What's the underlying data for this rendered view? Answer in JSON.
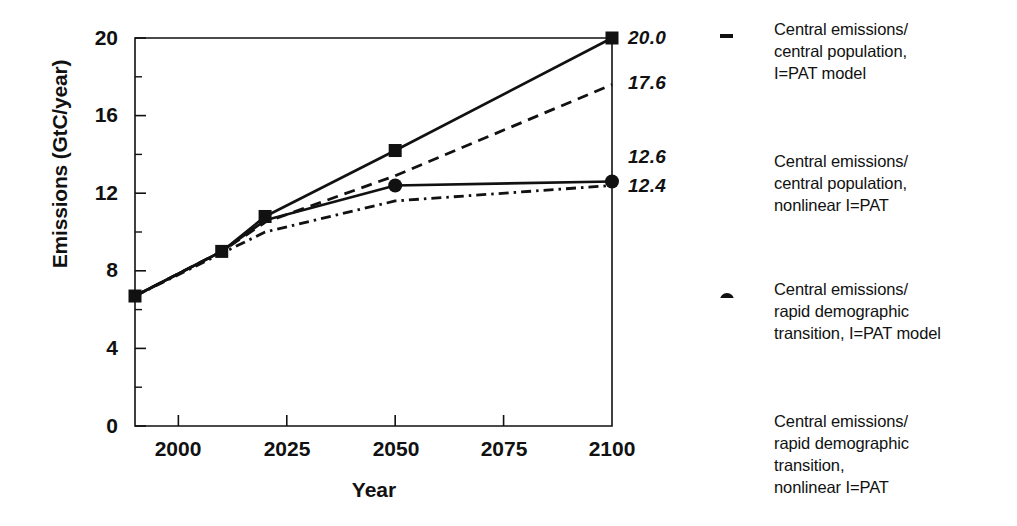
{
  "chart_data": {
    "type": "line",
    "title": "",
    "xlabel": "Year",
    "ylabel": "Emissions (GtC/year)",
    "xlim": [
      1990,
      2100
    ],
    "ylim": [
      0,
      20
    ],
    "grid": false,
    "legend_position": "right",
    "x_ticks": [
      "2000",
      "2025",
      "2050",
      "2075",
      "2100"
    ],
    "x_tick_values": [
      2000,
      2025,
      2050,
      2075,
      2100
    ],
    "y_ticks": [
      "0",
      "4",
      "8",
      "12",
      "16",
      "20"
    ],
    "y_tick_values": [
      0,
      4,
      8,
      12,
      16,
      20
    ],
    "y_minor_tick_values": [
      2,
      6,
      10,
      14,
      18
    ],
    "series": [
      {
        "name": "Central emissions/\ncentral population,\nI=PAT model",
        "style": "solid",
        "marker": "square",
        "x": [
          1990,
          2010,
          2020,
          2050,
          2100
        ],
        "values": [
          6.7,
          9.0,
          10.8,
          14.2,
          20.0
        ],
        "end_label": "20.0"
      },
      {
        "name": "Central emissions/\ncentral population,\nnonlinear I=PAT",
        "style": "dashed",
        "marker": "none",
        "x": [
          1990,
          2010,
          2020,
          2050,
          2100
        ],
        "values": [
          6.7,
          9.0,
          10.5,
          12.9,
          17.6
        ],
        "end_label": "17.6"
      },
      {
        "name": "Central emissions/\nrapid demographic\ntransition, I=PAT model",
        "style": "solid",
        "marker": "circle",
        "x": [
          1990,
          2010,
          2020,
          2050,
          2100
        ],
        "values": [
          6.7,
          9.0,
          10.6,
          12.4,
          12.6
        ],
        "end_label": "12.6"
      },
      {
        "name": "Central emissions/\nrapid demographic\ntransition,\nnonlinear I=PAT",
        "style": "dashdot",
        "marker": "none",
        "x": [
          1990,
          2010,
          2020,
          2050,
          2100
        ],
        "values": [
          6.7,
          8.9,
          10.0,
          11.6,
          12.4
        ],
        "end_label": "12.4"
      }
    ],
    "end_labels": [
      {
        "text": "20.0",
        "value": 20.0
      },
      {
        "text": "17.6",
        "value": 17.6
      },
      {
        "text": "12.6",
        "value": 12.6
      },
      {
        "text": "12.4",
        "value": 12.4
      }
    ],
    "colors": {
      "line": "#111111",
      "axis": "#111111",
      "background": "#ffffff"
    }
  },
  "legend": {
    "entries": [
      {
        "label": "Central emissions/\ncentral population,\nI=PAT model",
        "sample": "solid-square-line-sample"
      },
      {
        "label": "Central emissions/\ncentral population,\nnonlinear I=PAT",
        "sample": "dashed-line-sample"
      },
      {
        "label": "Central emissions/\nrapid demographic\ntransition, I=PAT model",
        "sample": "solid-circle-line-sample"
      },
      {
        "label": "Central emissions/\nrapid demographic\ntransition,\nnonlinear I=PAT",
        "sample": "dashdot-line-sample"
      }
    ]
  }
}
